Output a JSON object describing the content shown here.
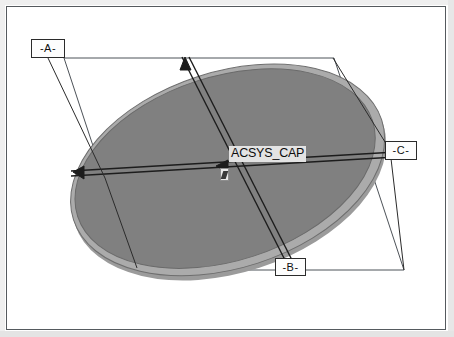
{
  "drawing": {
    "title": "ACSYS_CAP",
    "view_type": "isometric-datum-view",
    "part_label": "ACSYS_CAP",
    "datums": [
      {
        "id": "A",
        "label": "-A-",
        "position": "top-left",
        "leader_to": "top-vertex-of-plane"
      },
      {
        "id": "B",
        "label": "-B-",
        "position": "bottom-center",
        "leader_to": "minor-axis-lower-end"
      },
      {
        "id": "C",
        "label": "-C-",
        "position": "right",
        "leader_to": "major-axis-right-end"
      }
    ],
    "geometry": {
      "reference_plane": "parallelogram",
      "feature": "elliptical-disc",
      "axes": [
        "major-axis",
        "minor-axis"
      ],
      "datum_triangles": 3
    },
    "colors": {
      "disc_top": "#808080",
      "disc_rim": "#a9a9a9",
      "disc_shadow": "#9a9a9a",
      "line": "#1c1c1c",
      "plane_line": "#4a4a4a",
      "frame": "#555a5e",
      "background": "#ffffff",
      "label_bg": "#e3e3e3"
    }
  }
}
